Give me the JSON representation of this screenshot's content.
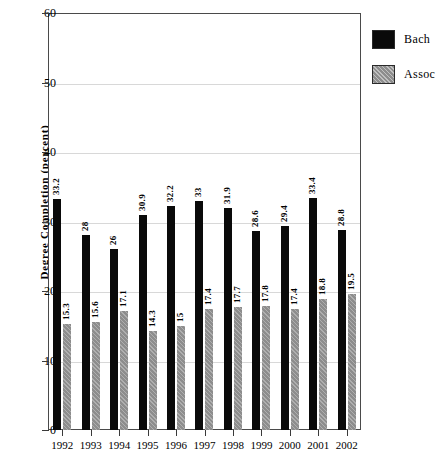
{
  "chart_data": {
    "type": "bar",
    "title": "",
    "subtitle": "",
    "xlabel": "",
    "ylabel": "Degree Completion (percent)",
    "categories": [
      "1992",
      "1993",
      "1994",
      "1995",
      "1996",
      "1997",
      "1998",
      "1999",
      "2000",
      "2001",
      "2002"
    ],
    "series": [
      {
        "name": "Bach",
        "color": "#0a0a0a",
        "values": [
          33.2,
          28,
          26,
          30.9,
          32.2,
          33,
          31.9,
          28.6,
          29.4,
          33.4,
          28.8
        ],
        "labels": [
          "33.2",
          "28",
          "26",
          "30.9",
          "32.2",
          "33",
          "31.9",
          "28.6",
          "29.4",
          "33.4",
          "28.8"
        ]
      },
      {
        "name": "Assoc",
        "color": "#8d8d8d",
        "values": [
          15.3,
          15.6,
          17.1,
          14.3,
          15,
          17.4,
          17.7,
          17.8,
          17.4,
          18.8,
          19.5
        ],
        "labels": [
          "15.3",
          "15.6",
          "17.1",
          "14.3",
          "15",
          "17.4",
          "17.7",
          "17.8",
          "17.4",
          "18.8",
          "19.5"
        ]
      }
    ],
    "ylim": [
      0,
      60
    ],
    "yticks": [
      0,
      10,
      20,
      30,
      40,
      50,
      60
    ],
    "ytick_labels": [
      "0",
      "10",
      "20",
      "30",
      "40",
      "50",
      "60"
    ],
    "grid": true,
    "grid_axis": "y",
    "legend_position": "right-top",
    "data_labels_rotated": true
  },
  "legend": {
    "items": [
      {
        "label": "Bach"
      },
      {
        "label": "Assoc"
      }
    ]
  }
}
